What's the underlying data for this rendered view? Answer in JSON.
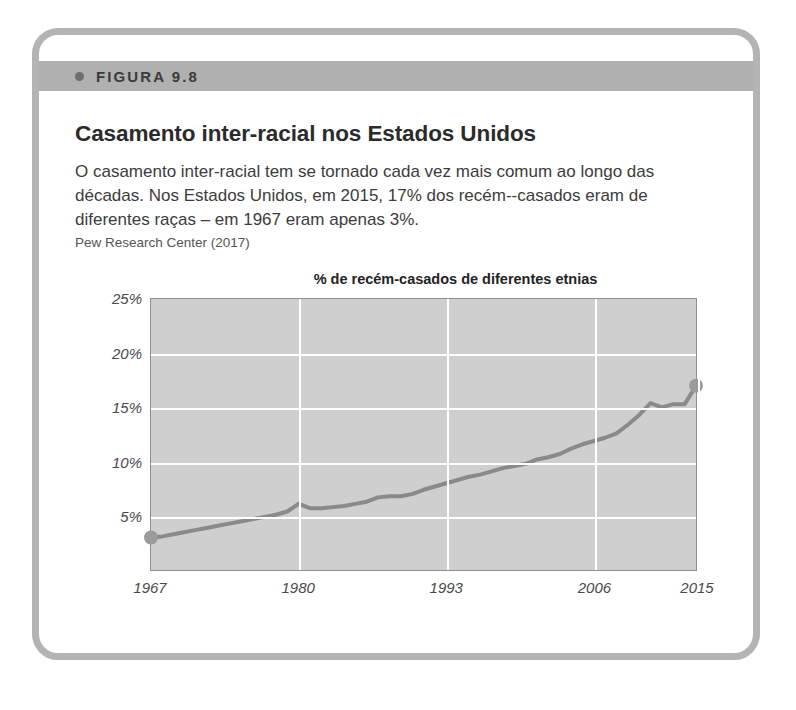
{
  "figure": {
    "header_label": "FIGURA 9.8",
    "bullet_icon": "bullet-dot-icon",
    "title": "Casamento inter-racial nos Estados Unidos",
    "description": "O casamento inter-racial tem se tornado cada vez mais comum ao longo das décadas. Nos Estados Unidos, em 2015, 17% dos recém--casados eram de diferentes raças – em 1967 eram apenas 3%.",
    "source": "Pew Research Center (2017)"
  },
  "colors": {
    "card_border": "#b4b4b4",
    "header_band": "#b0b0b0",
    "plot_background": "#cfcfcf",
    "gridline": "#ffffff",
    "series_line": "#8a8a8a",
    "marker": "#9a9a9a",
    "title_text": "#2b2b2b",
    "body_text": "#3c3c3c"
  },
  "chart_data": {
    "type": "line",
    "title": "% de recém-casados de diferentes etnias",
    "xlabel": "",
    "ylabel": "",
    "xlim": [
      1967,
      2015
    ],
    "ylim": [
      0,
      25
    ],
    "grid": true,
    "legend": "none",
    "y_ticks": [
      "5%",
      "10%",
      "15%",
      "20%",
      "25%"
    ],
    "y_tick_values": [
      5,
      10,
      15,
      20,
      25
    ],
    "x_ticks": [
      "1967",
      "1980",
      "1993",
      "2006",
      "2015"
    ],
    "x_tick_values": [
      1967,
      1980,
      1993,
      2006,
      2015
    ],
    "gridlines_x": [
      1980,
      1993,
      2006,
      2015
    ],
    "markers": [
      {
        "x": 1967,
        "y": 3.0,
        "label": "start-marker"
      },
      {
        "x": 2015,
        "y": 17.0,
        "label": "end-marker"
      }
    ],
    "series": [
      {
        "name": "% de recém-casados de diferentes etnias",
        "x": [
          1967,
          1968,
          1969,
          1970,
          1971,
          1972,
          1973,
          1974,
          1975,
          1976,
          1977,
          1978,
          1979,
          1980,
          1981,
          1982,
          1983,
          1984,
          1985,
          1986,
          1987,
          1988,
          1989,
          1990,
          1991,
          1992,
          1993,
          1994,
          1995,
          1996,
          1997,
          1998,
          1999,
          2000,
          2001,
          2002,
          2003,
          2004,
          2005,
          2006,
          2007,
          2008,
          2009,
          2010,
          2011,
          2012,
          2013,
          2014,
          2015
        ],
        "values": [
          3.0,
          3.1,
          3.3,
          3.5,
          3.7,
          3.9,
          4.1,
          4.3,
          4.5,
          4.7,
          4.9,
          5.1,
          5.4,
          6.1,
          5.7,
          5.7,
          5.8,
          5.9,
          6.1,
          6.3,
          6.7,
          6.8,
          6.8,
          7.0,
          7.4,
          7.7,
          8.0,
          8.3,
          8.6,
          8.8,
          9.1,
          9.4,
          9.6,
          9.8,
          10.2,
          10.4,
          10.7,
          11.2,
          11.6,
          11.9,
          12.2,
          12.6,
          13.4,
          14.3,
          15.4,
          15.0,
          15.3,
          15.3,
          17.0
        ]
      }
    ]
  }
}
